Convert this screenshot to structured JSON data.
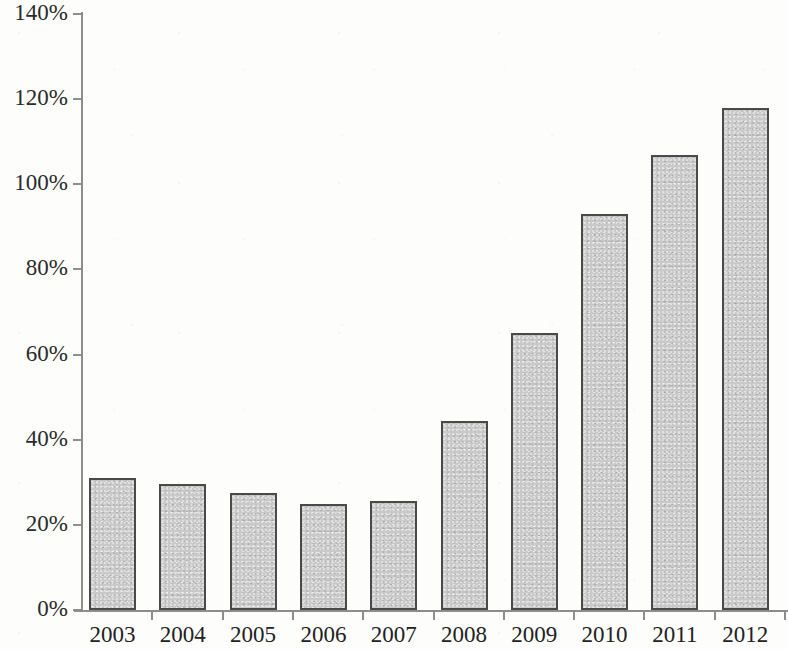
{
  "chart_data": {
    "type": "bar",
    "title": "",
    "subtitle": "",
    "xlabel": "",
    "ylabel": "",
    "categories": [
      "2003",
      "2004",
      "2005",
      "2006",
      "2007",
      "2008",
      "2009",
      "2010",
      "2011",
      "2012"
    ],
    "values": [
      31,
      29.5,
      27.5,
      25,
      25.5,
      44.5,
      65,
      93,
      107,
      118
    ],
    "value_suffix": "%",
    "ylim": [
      0,
      140
    ],
    "ytick_values": [
      0,
      20,
      40,
      60,
      80,
      100,
      120,
      140
    ],
    "ytick_labels": [
      "0%",
      "20%",
      "40%",
      "60%",
      "80%",
      "100%",
      "120%",
      "140%"
    ],
    "grid": false,
    "legend": null,
    "legend_position": "none",
    "annotations": [],
    "series": [
      {
        "name": "",
        "values": [
          31,
          29.5,
          27.5,
          25,
          25.5,
          44.5,
          65,
          93,
          107,
          118
        ]
      }
    ],
    "style": {
      "bar_fill": "#c9c9c9",
      "bar_border": "#4a4a4a",
      "axis_color": "#8d8d8d",
      "text_color": "#222222",
      "background": "#fdfdfc"
    }
  }
}
